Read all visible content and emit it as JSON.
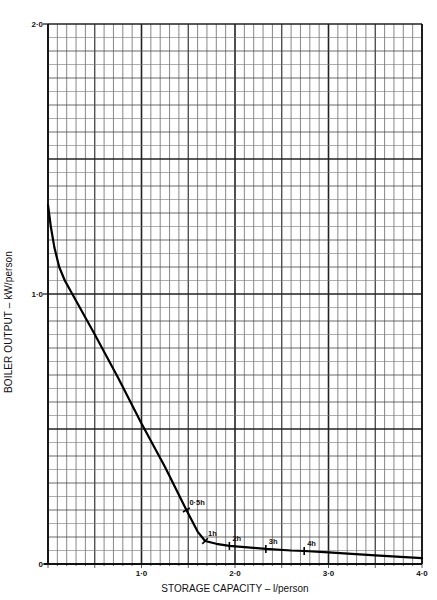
{
  "chart_data": {
    "type": "line",
    "title": "",
    "xlabel": "STORAGE CAPACITY – l/person",
    "ylabel": "BOILER OUTPUT – kW/person",
    "xlim": [
      0,
      4.0
    ],
    "ylim": [
      0,
      2.0
    ],
    "x_ticks": [
      {
        "value": 1.0,
        "label": "1·0"
      },
      {
        "value": 2.0,
        "label": "2·0"
      },
      {
        "value": 3.0,
        "label": "3·0"
      },
      {
        "value": 4.0,
        "label": "4·0"
      }
    ],
    "y_ticks": [
      {
        "value": 0,
        "label": "0"
      },
      {
        "value": 1.0,
        "label": "1·0"
      },
      {
        "value": 2.0,
        "label": "2·0"
      }
    ],
    "grid": {
      "on": true,
      "x_minor_step": 0.1,
      "x_major_step": 0.5,
      "y_minor_step": 0.05,
      "y_major_step": 0.5
    },
    "legend": null,
    "series": [
      {
        "name": "Boiler output vs storage capacity",
        "x": [
          0.0,
          0.03,
          0.07,
          0.12,
          0.18,
          0.26,
          0.5,
          0.75,
          1.0,
          1.25,
          1.48,
          1.6,
          1.68,
          1.8,
          1.94,
          2.2,
          2.33,
          2.6,
          2.74,
          3.0,
          3.5,
          4.0
        ],
        "y": [
          1.33,
          1.25,
          1.17,
          1.1,
          1.05,
          1.0,
          0.85,
          0.69,
          0.52,
          0.36,
          0.2,
          0.12,
          0.085,
          0.075,
          0.067,
          0.06,
          0.056,
          0.05,
          0.048,
          0.043,
          0.032,
          0.022
        ]
      }
    ],
    "annotations": [
      {
        "label": "0·5h",
        "x": 1.48,
        "y": 0.2
      },
      {
        "label": "1h",
        "x": 1.68,
        "y": 0.085
      },
      {
        "label": "2h",
        "x": 1.94,
        "y": 0.067
      },
      {
        "label": "3h",
        "x": 2.33,
        "y": 0.056
      },
      {
        "label": "4h",
        "x": 2.74,
        "y": 0.048
      }
    ]
  }
}
